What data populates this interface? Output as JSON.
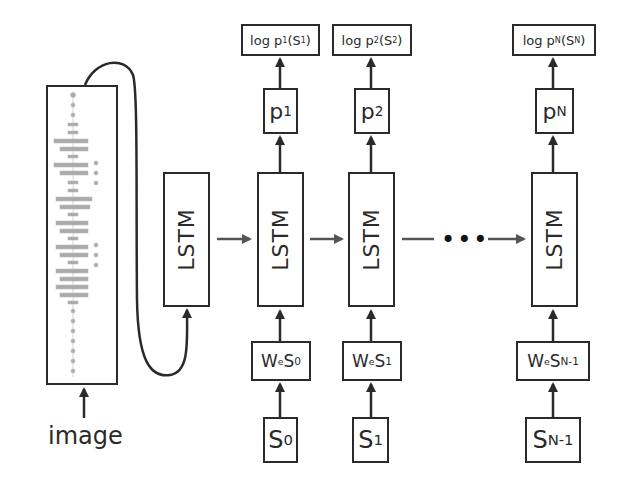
{
  "diagram": {
    "input_caption": "image",
    "encoder": {
      "label": "LSTM"
    },
    "steps": [
      {
        "lstm": "LSTM",
        "embed": {
          "prefix": "W",
          "sub_e": "e",
          "s": "S",
          "s_sub": "0"
        },
        "input": {
          "s": "S",
          "sub": "0"
        },
        "prob": {
          "p": "p",
          "sub": "1"
        },
        "loss": {
          "prefix": "log p",
          "p_sub": "1",
          "open": "(S",
          "s_sub": "1",
          "close": ")"
        }
      },
      {
        "lstm": "LSTM",
        "embed": {
          "prefix": "W",
          "sub_e": "e",
          "s": "S",
          "s_sub": "1"
        },
        "input": {
          "s": "S",
          "sub": "1"
        },
        "prob": {
          "p": "p",
          "sub": "2"
        },
        "loss": {
          "prefix": "log p",
          "p_sub": "2",
          "open": "(S",
          "s_sub": "2",
          "close": ")"
        }
      },
      {
        "lstm": "LSTM",
        "embed": {
          "prefix": "W",
          "sub_e": "e",
          "s": "S",
          "s_sub": "N-1"
        },
        "input": {
          "s": "S",
          "sub": "N-1"
        },
        "prob": {
          "p": "p",
          "sub": "N"
        },
        "loss": {
          "prefix": "log p",
          "p_sub": "N",
          "open": "(S",
          "s_sub": "N",
          "close": ")"
        }
      }
    ],
    "ellipsis": "•••",
    "colors": {
      "stroke": "#2a2a2a",
      "arrow_gray": "#555555",
      "cnn_graph": "#999999"
    }
  }
}
